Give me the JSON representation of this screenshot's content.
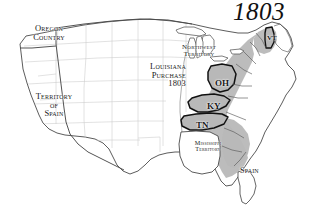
{
  "map": {
    "title": "1803",
    "background_color": "#ffffff",
    "ink_color": "#3a3a3a",
    "state_fill_gray": "#b8b8b8",
    "unorganized_fill": "#ffffff",
    "faint_border_color": "#c9c9c9",
    "bold_outline_color": "#111111",
    "regions": [
      {
        "id": "oregon-country",
        "lines": [
          "Oregon",
          "Country"
        ],
        "fill": "#ffffff"
      },
      {
        "id": "territory-of-spain",
        "lines": [
          "Territory",
          "of",
          "Spain"
        ],
        "fill": "#ffffff"
      },
      {
        "id": "louisiana-purchase",
        "lines": [
          "Louisiana",
          "Purchase",
          "1803"
        ],
        "fill": "#ffffff"
      },
      {
        "id": "northwest-territory",
        "lines": [
          "Northwest",
          "Territory"
        ],
        "fill": "#ffffff"
      },
      {
        "id": "mississippi-territory",
        "lines": [
          "Mississippi",
          "Territory"
        ],
        "fill": "#ffffff"
      },
      {
        "id": "spain-florida",
        "lines": [
          "Spain"
        ],
        "fill": "#ffffff"
      }
    ],
    "states_highlighted": [
      {
        "abbr": "OH",
        "name": "Ohio",
        "fill": "#b8b8b8",
        "outline": "bold"
      },
      {
        "abbr": "KY",
        "name": "Kentucky",
        "fill": "#b8b8b8",
        "outline": "bold"
      },
      {
        "abbr": "TN",
        "name": "Tennessee",
        "fill": "#b8b8b8",
        "outline": "bold"
      },
      {
        "abbr": "VT",
        "name": "Vermont",
        "fill": "#b8b8b8",
        "outline": "bold"
      }
    ],
    "shaded_area_note": "Eastern seaboard states shaded gray; Maine left unshaded"
  }
}
